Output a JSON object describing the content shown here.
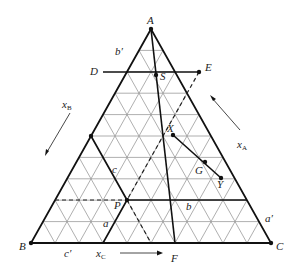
{
  "diagram": {
    "type": "ternary-phase-diagram",
    "vertices": {
      "A": {
        "label": "A"
      },
      "B": {
        "label": "B"
      },
      "C": {
        "label": "C"
      }
    },
    "points": {
      "D": "D",
      "E": "E",
      "F": "F",
      "S": "S",
      "X": "X",
      "G": "G",
      "Y": "Y",
      "P": "P"
    },
    "segment_labels": {
      "a": "a",
      "b": "b",
      "c": "c",
      "a_prime": "a′",
      "b_prime": "b′",
      "c_prime": "c′"
    },
    "axes": {
      "xA": {
        "base": "x",
        "sub": "A"
      },
      "xB": {
        "base": "x",
        "sub": "B"
      },
      "xC": {
        "base": "x",
        "sub": "C"
      }
    },
    "grid_divisions": 10
  }
}
